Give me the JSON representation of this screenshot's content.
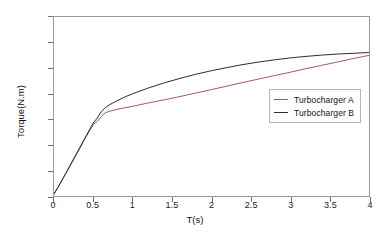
{
  "chart_data": {
    "type": "line",
    "title": "",
    "xlabel": "T(s)",
    "ylabel": "Torque(N.m)",
    "xlim": [
      0,
      4
    ],
    "ylim": [
      0,
      1400
    ],
    "xticks": [
      "0",
      "0.5",
      "1",
      "1.5",
      "2",
      "2.5",
      "3",
      "3.5",
      "4"
    ],
    "xtick_values": [
      0,
      0.5,
      1,
      1.5,
      2,
      2.5,
      3,
      3.5,
      4
    ],
    "yticks": [
      "0",
      "200",
      "400",
      "600",
      "800",
      "1000",
      "1200",
      "1400"
    ],
    "ytick_values": [
      0,
      200,
      400,
      600,
      800,
      1000,
      1200,
      1400
    ],
    "grid": false,
    "legend_position": "center-right",
    "series": [
      {
        "name": "Turbocharger A",
        "color": "#a8576a",
        "x": [
          0,
          0.1,
          0.2,
          0.3,
          0.4,
          0.5,
          0.55,
          0.6,
          0.65,
          0.7,
          0.8,
          0.9,
          1.0,
          1.2,
          1.4,
          1.6,
          1.8,
          2.0,
          2.2,
          2.4,
          2.6,
          2.8,
          3.0,
          3.2,
          3.4,
          3.6,
          3.8,
          4.0
        ],
        "y": [
          15,
          120,
          230,
          340,
          455,
          560,
          585,
          620,
          650,
          662,
          678,
          690,
          702,
          728,
          752,
          778,
          805,
          832,
          860,
          888,
          915,
          942,
          968,
          996,
          1022,
          1048,
          1075,
          1100
        ]
      },
      {
        "name": "Turbocharger B",
        "color": "#2b2b3c",
        "x": [
          0,
          0.1,
          0.2,
          0.3,
          0.4,
          0.5,
          0.55,
          0.6,
          0.65,
          0.7,
          0.8,
          0.9,
          1.0,
          1.2,
          1.4,
          1.6,
          1.8,
          2.0,
          2.2,
          2.4,
          2.6,
          2.8,
          3.0,
          3.2,
          3.4,
          3.6,
          3.8,
          4.0
        ],
        "y": [
          15,
          122,
          235,
          348,
          462,
          572,
          610,
          660,
          690,
          712,
          745,
          775,
          800,
          845,
          885,
          920,
          952,
          980,
          1005,
          1028,
          1048,
          1065,
          1080,
          1092,
          1102,
          1110,
          1116,
          1122
        ]
      }
    ]
  }
}
